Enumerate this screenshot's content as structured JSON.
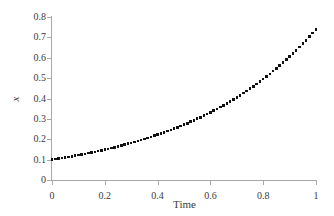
{
  "chart_data": {
    "type": "scatter",
    "title": "",
    "subtitle": "",
    "xlabel": "Time",
    "ylabel": "x",
    "xlim": [
      0,
      1
    ],
    "ylim": [
      0,
      0.8
    ],
    "grid": false,
    "legend": null,
    "legend_position": "none",
    "marker": "square",
    "marker_color": "#111111",
    "axis_color": "#a8a8a8",
    "text_color": "#3a3a3a",
    "background_color": "#ffffff",
    "xticks": [
      "0",
      "0.2",
      "0.4",
      "0.6",
      "0.8",
      "1"
    ],
    "xtick_values": [
      0,
      0.2,
      0.4,
      0.6,
      0.8,
      1
    ],
    "yticks": [
      "0",
      "0.1",
      "0.2",
      "0.3",
      "0.4",
      "0.5",
      "0.6",
      "0.7",
      "0.8"
    ],
    "ytick_values": [
      0,
      0.1,
      0.2,
      0.3,
      0.4,
      0.5,
      0.6,
      0.7,
      0.8
    ],
    "series": [
      {
        "name": "x(t)",
        "x": [
          0,
          0.0125,
          0.025,
          0.0375,
          0.05,
          0.0625,
          0.075,
          0.0875,
          0.1,
          0.1125,
          0.125,
          0.1375,
          0.15,
          0.1625,
          0.175,
          0.1875,
          0.2,
          0.2125,
          0.225,
          0.2375,
          0.25,
          0.2625,
          0.275,
          0.2875,
          0.3,
          0.3125,
          0.325,
          0.3375,
          0.35,
          0.3625,
          0.375,
          0.3875,
          0.4,
          0.4125,
          0.425,
          0.4375,
          0.45,
          0.4625,
          0.475,
          0.4875,
          0.5,
          0.5125,
          0.525,
          0.5375,
          0.55,
          0.5625,
          0.575,
          0.5875,
          0.6,
          0.6125,
          0.625,
          0.6375,
          0.65,
          0.6625,
          0.675,
          0.6875,
          0.7,
          0.7125,
          0.725,
          0.7375,
          0.75,
          0.7625,
          0.775,
          0.7875,
          0.8,
          0.8125,
          0.825,
          0.8375,
          0.85,
          0.8625,
          0.875,
          0.8875,
          0.9,
          0.9125,
          0.925,
          0.9375,
          0.95,
          0.9625,
          0.975,
          0.9875,
          1
        ],
        "y": [
          0.1,
          0.1025,
          0.1051,
          0.1078,
          0.1105,
          0.1133,
          0.1162,
          0.1191,
          0.1221,
          0.1252,
          0.1284,
          0.1316,
          0.135,
          0.1384,
          0.1419,
          0.1455,
          0.1492,
          0.1529,
          0.1568,
          0.1608,
          0.1649,
          0.169,
          0.1733,
          0.1777,
          0.1822,
          0.1868,
          0.1916,
          0.1964,
          0.2014,
          0.2065,
          0.2117,
          0.217,
          0.2226,
          0.2282,
          0.234,
          0.2399,
          0.246,
          0.2522,
          0.2586,
          0.2652,
          0.2718,
          0.2787,
          0.2858,
          0.293,
          0.3004,
          0.308,
          0.3158,
          0.3238,
          0.332,
          0.3404,
          0.349,
          0.3578,
          0.3669,
          0.3762,
          0.3857,
          0.3955,
          0.4055,
          0.4158,
          0.4263,
          0.4372,
          0.4482,
          0.4596,
          0.4713,
          0.4833,
          0.4953,
          0.508,
          0.5209,
          0.5341,
          0.5477,
          0.5616,
          0.5758,
          0.5904,
          0.6049,
          0.6204,
          0.6362,
          0.6523,
          0.6687,
          0.6856,
          0.703,
          0.7208,
          0.7389
        ]
      }
    ]
  },
  "axis_titles": {
    "x": "Time",
    "y": "x"
  }
}
